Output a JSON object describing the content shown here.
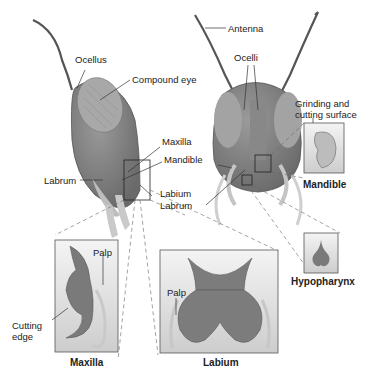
{
  "diagram": {
    "side_view_labels": {
      "ocellus": "Ocellus",
      "compound_eye": "Compound eye",
      "maxilla": "Maxilla",
      "mandible": "Mandible",
      "labium": "Labium",
      "labrum": "Labrum"
    },
    "front_view_labels": {
      "antenna": "Antenna",
      "ocelli": "Ocelli",
      "labrum": "Labrum"
    },
    "insets": {
      "mandible": {
        "title": "Mandible",
        "callout_line1": "Grinding and",
        "callout_line2": "cutting surface"
      },
      "hypopharynx": {
        "title": "Hypopharynx"
      },
      "maxilla": {
        "title": "Maxilla",
        "palp": "Palp",
        "cutting_edge_line1": "Cutting",
        "cutting_edge_line2": "edge"
      },
      "labium": {
        "title": "Labium",
        "palp": "Palp"
      }
    },
    "colors": {
      "body": "#7d7d7d",
      "eye": "#a9a9a9",
      "pale": "#c8c8c8",
      "box_top": "#f2f2f2",
      "box_bottom": "#cfcfcf",
      "line": "#333333"
    }
  }
}
